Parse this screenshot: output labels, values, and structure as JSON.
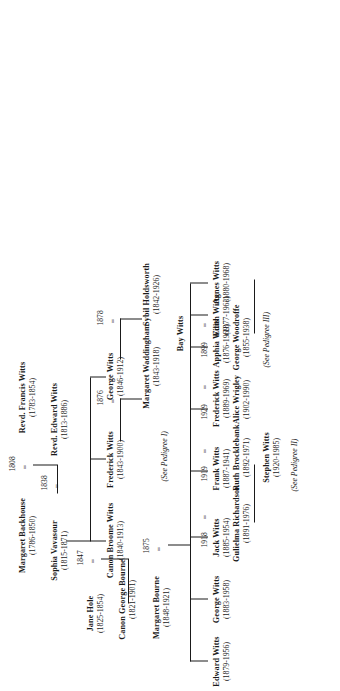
{
  "document": {
    "kind": "pedigree-chart",
    "orientation": "landscape-plate-rotated-90",
    "ink_color": "#1a1a1a",
    "page_color": "#ffffff"
  },
  "people": {
    "margaret_backhouse": {
      "name": "Margaret Backhouse",
      "dates": "(1786-1850)"
    },
    "francis_witts": {
      "name": "Revd. Francis Witts",
      "dates": "(1783-1854)"
    },
    "sophia_vavasour": {
      "name": "Sophia Vavasour",
      "dates": "(1815-1871)"
    },
    "edward_witts_1813": {
      "name": "Revd. Edward Witts",
      "dates": "(1813-1886)"
    },
    "jane_hole": {
      "name": "Jane Hole",
      "dates": "(1825-1854)"
    },
    "george_bourne": {
      "name": "Canon George Bourne",
      "dates": "(1821-1901)"
    },
    "margaret_bourne": {
      "name": "Margaret Bourne",
      "dates": "(1848-1921)"
    },
    "broome_witts": {
      "name": "Canon Broome Witts",
      "dates": "(1840-1913)"
    },
    "frederick_witts_1843": {
      "name": "Frederick Witts",
      "dates": "(1843-1900)"
    },
    "margaret_waddingham": {
      "name": "Margaret Waddingham",
      "dates": "(1843-1918)"
    },
    "george_witts_1846": {
      "name": "George Witts",
      "dates": "(1846-1912)"
    },
    "sybil_holdsworth": {
      "name": "Sybil Holdsworth",
      "dates": "(1842-1926)"
    },
    "edward_witts_1879": {
      "name": "Edward Witts",
      "dates": "(1879-1956)"
    },
    "george_witts_1883": {
      "name": "George Witts",
      "dates": "(1883-1958)"
    },
    "jack_witts": {
      "name": "Jack Witts",
      "dates": "(1885-1954)"
    },
    "gulielma_richardson": {
      "name": "Gulielma Richardson",
      "dates": "(1891-1976)"
    },
    "frank_witts": {
      "name": "Frank Witts",
      "dates": "(1887-1941)"
    },
    "ruth_brocklebank": {
      "name": "Ruth Brocklebank",
      "dates": "(1892-1971)"
    },
    "frederick_witts_1889": {
      "name": "Frederick Witts",
      "dates": "(1889-1969)"
    },
    "alice_wrigley": {
      "name": "Alice Wrigley",
      "dates": "(1902-1990)"
    },
    "apphia_witts": {
      "name": "Apphia Witts",
      "dates": "(1876-1969)"
    },
    "george_woodroffe": {
      "name": "George Woodroffe",
      "dates": "(1855-1938)"
    },
    "edith_witts": {
      "name": "Edith Witts",
      "dates": "(1877-1963)"
    },
    "agnes_witts": {
      "name": "Agnes Witts",
      "dates": "(1880-1968)"
    },
    "bay_witts": {
      "name": "Bay Witts",
      "dates": ""
    },
    "stephen_witts": {
      "name": "Stephen Witts",
      "dates": "(1920-1985)"
    }
  },
  "marriages": {
    "m1808": {
      "year": "1808",
      "sign": "="
    },
    "m1838": {
      "year": "1838",
      "sign": "="
    },
    "m1847": {
      "year": "1847",
      "sign": "="
    },
    "m1875": {
      "year": "1875",
      "sign": "="
    },
    "m1876": {
      "year": "1876",
      "sign": "="
    },
    "m1878": {
      "year": "1878",
      "sign": "="
    },
    "m1899": {
      "year": "1899",
      "sign": "="
    },
    "m1918": {
      "year": "1918",
      "sign": "="
    },
    "m1919": {
      "year": "1919",
      "sign": "="
    },
    "m1929": {
      "year": "1929",
      "sign": "="
    }
  },
  "references": {
    "ped1": "(See Pedigree I)",
    "ped2": "(See Pedigree II)",
    "ped3": "(See Pedigree III)"
  }
}
